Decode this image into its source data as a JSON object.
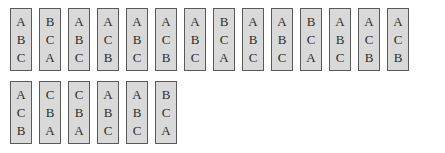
{
  "rows": [
    {
      "cards": [
        [
          "A",
          "B",
          "C"
        ],
        [
          "B",
          "C",
          "A"
        ],
        [
          "A",
          "B",
          "C"
        ],
        [
          "A",
          "C",
          "B"
        ],
        [
          "A",
          "B",
          "C"
        ],
        [
          "A",
          "C",
          "B"
        ],
        [
          "A",
          "B",
          "C"
        ],
        [
          "B",
          "C",
          "A"
        ],
        [
          "A",
          "B",
          "C"
        ],
        [
          "A",
          "B",
          "C"
        ],
        [
          "B",
          "C",
          "A"
        ],
        [
          "A",
          "B",
          "C"
        ],
        [
          "A",
          "C",
          "B"
        ],
        [
          "A",
          "C",
          "B"
        ]
      ]
    },
    {
      "cards": [
        [
          "A",
          "C",
          "B"
        ],
        [
          "C",
          "B",
          "A"
        ],
        [
          "C",
          "B",
          "A"
        ],
        [
          "A",
          "B",
          "C"
        ],
        [
          "A",
          "B",
          "C"
        ],
        [
          "B",
          "C",
          "A"
        ]
      ]
    }
  ],
  "colors": {
    "card_fill": "#d9d9d9",
    "card_border": "#5a5a5a",
    "letter": "#2e2e2e"
  }
}
